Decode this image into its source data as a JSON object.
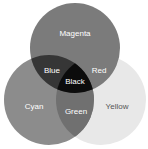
{
  "diagram": {
    "type": "venn",
    "circles": [
      {
        "label": "Magenta",
        "color": "#7b7b7b"
      },
      {
        "label": "Cyan",
        "color": "#8c8c8c"
      },
      {
        "label": "Yellow",
        "color": "#e8e8e8"
      }
    ],
    "overlaps": {
      "magenta_cyan": {
        "label": "Blue",
        "color": "#363636"
      },
      "magenta_yellow": {
        "label": "Red",
        "color": "#7b7b7b"
      },
      "cyan_yellow": {
        "label": "Green",
        "color": "#707070"
      },
      "all": {
        "label": "Black",
        "color": "#0c0c0c"
      }
    }
  }
}
